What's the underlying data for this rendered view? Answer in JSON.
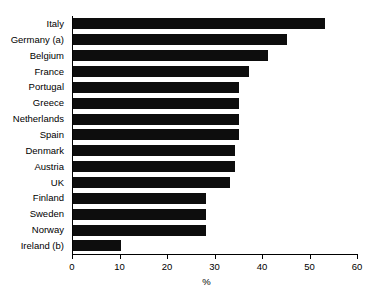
{
  "chart_data": {
    "type": "bar",
    "orientation": "horizontal",
    "title": "",
    "xlabel": "%",
    "ylabel": "",
    "xlim": [
      0,
      60
    ],
    "xticks": [
      0,
      10,
      20,
      30,
      40,
      50,
      60
    ],
    "xtick_labels": [
      "0",
      "10",
      "20",
      "30",
      "40",
      "50",
      "60"
    ],
    "grid": false,
    "legend": false,
    "bar_color": "#0d0d0d",
    "categories": [
      "Italy",
      "Germany (a)",
      "Belgium",
      "France",
      "Portugal",
      "Greece",
      "Netherlands",
      "Spain",
      "Denmark",
      "Austria",
      "UK",
      "Finland",
      "Sweden",
      "Norway",
      "Ireland (b)"
    ],
    "values": [
      53,
      45,
      41,
      37,
      35,
      35,
      35,
      35,
      34,
      34,
      33,
      28,
      28,
      28,
      10
    ]
  }
}
